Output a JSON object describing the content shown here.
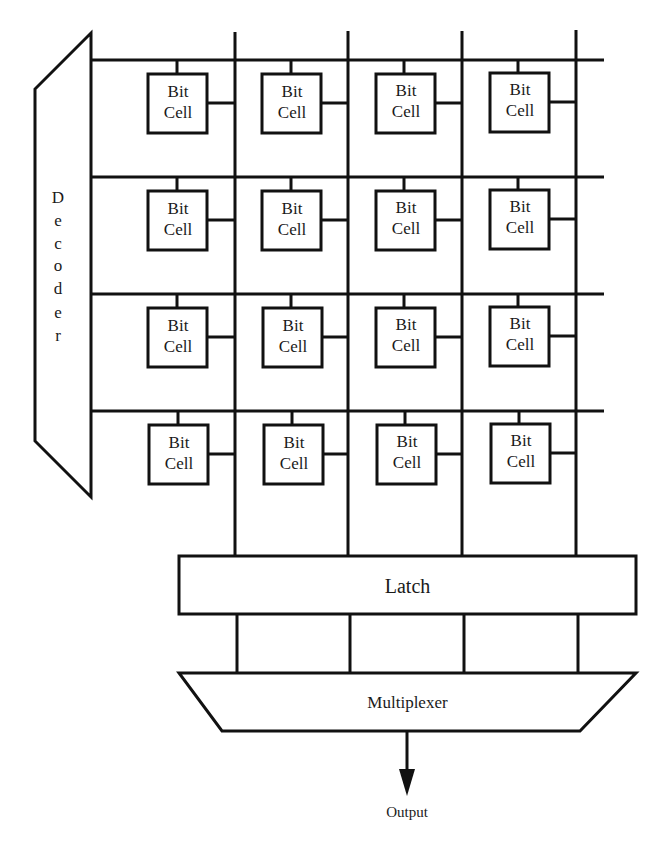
{
  "diagram": {
    "type": "memory-array-block-diagram",
    "decoder": {
      "label": "Decoder",
      "letters": [
        "D",
        "e",
        "c",
        "o",
        "d",
        "e",
        "r"
      ]
    },
    "cell_label_line1": "Bit",
    "cell_label_line2": "Cell",
    "rows": 4,
    "columns": 4,
    "cells": [
      [
        {
          "l1": "Bit",
          "l2": "Cell"
        },
        {
          "l1": "Bit",
          "l2": "Cell"
        },
        {
          "l1": "Bit",
          "l2": "Cell"
        },
        {
          "l1": "Bit",
          "l2": "Cell"
        }
      ],
      [
        {
          "l1": "Bit",
          "l2": "Cell"
        },
        {
          "l1": "Bit",
          "l2": "Cell"
        },
        {
          "l1": "Bit",
          "l2": "Cell"
        },
        {
          "l1": "Bit",
          "l2": "Cell"
        }
      ],
      [
        {
          "l1": "Bit",
          "l2": "Cell"
        },
        {
          "l1": "Bit",
          "l2": "Cell"
        },
        {
          "l1": "Bit",
          "l2": "Cell"
        },
        {
          "l1": "Bit",
          "l2": "Cell"
        }
      ],
      [
        {
          "l1": "Bit",
          "l2": "Cell"
        },
        {
          "l1": "Bit",
          "l2": "Cell"
        },
        {
          "l1": "Bit",
          "l2": "Cell"
        },
        {
          "l1": "Bit",
          "l2": "Cell"
        }
      ]
    ],
    "latch": {
      "label": "Latch"
    },
    "multiplexer": {
      "label": "Multiplexer"
    },
    "output": {
      "label": "Output"
    },
    "colors": {
      "line": "#111111",
      "background": "#ffffff",
      "text": "#1a1a1a"
    }
  }
}
